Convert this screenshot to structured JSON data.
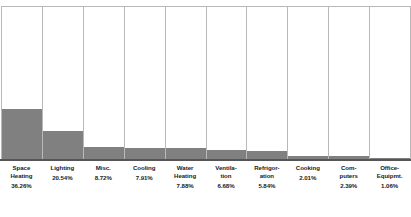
{
  "chart_data": {
    "type": "bar",
    "title": "",
    "subtitle": "",
    "xlabel": "",
    "ylabel": "",
    "grid": false,
    "legend": "none",
    "orientation": "vertical",
    "axis_ranges": {
      "ylim": [
        0,
        100
      ]
    },
    "note": "Each category is drawn as a full-height outlined container column filled from the bottom in gray in proportion to its percentage of total energy end-use.",
    "categories": [
      "Space Heating",
      "Lighting",
      "Misc.",
      "Cooling",
      "Water\nHeating",
      "Ventila-\ntion",
      "Refrigor-\nation",
      "Cooking",
      "Com-\nputers",
      "Office-\nEquipmt."
    ],
    "values": [
      36.26,
      20.54,
      8.72,
      7.91,
      7.88,
      6.68,
      5.84,
      2.01,
      2.39,
      1.06
    ],
    "value_labels": [
      "36.26%",
      "20.54%",
      "8.72%",
      "7.91%",
      "7.88%",
      "6.68%",
      "5.84%",
      "2.01%",
      "2.39%",
      "1.06%"
    ],
    "colors": {
      "fill": "#808080",
      "column_background": "#ffffff",
      "column_border": "#b9b9b9",
      "baseline": "#555555",
      "label_text": "#1a1a1a"
    }
  }
}
